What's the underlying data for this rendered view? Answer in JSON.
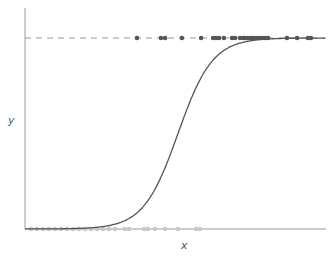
{
  "chart_data": {
    "type": "scatter",
    "title": "",
    "xlabel": "x",
    "ylabel": "y",
    "xlim": [
      0,
      1
    ],
    "ylim": [
      0,
      1
    ],
    "grid": false,
    "legend": null,
    "reference_line": {
      "y": 1,
      "style": "dashed",
      "color": "#999999"
    },
    "curve": {
      "name": "logistic fit",
      "type": "sigmoid",
      "midpoint_x": 0.51,
      "steepness": 17.4,
      "color": "#555555"
    },
    "series": [
      {
        "name": "y = 1",
        "color": "#555555",
        "y": 1,
        "x": [
          0.373,
          0.453,
          0.467,
          0.523,
          0.587,
          0.627,
          0.637,
          0.647,
          0.663,
          0.69,
          0.7,
          0.717,
          0.727,
          0.733,
          0.743,
          0.753,
          0.76,
          0.77,
          0.78,
          0.79,
          0.8,
          0.81,
          0.873,
          0.907,
          0.943,
          0.953
        ]
      },
      {
        "name": "y = 0",
        "color": "#c8c8c8",
        "y": 0,
        "x": [
          0.02,
          0.04,
          0.06,
          0.08,
          0.1,
          0.12,
          0.14,
          0.16,
          0.18,
          0.2,
          0.22,
          0.24,
          0.26,
          0.28,
          0.3,
          0.333,
          0.347,
          0.397,
          0.41,
          0.433,
          0.467,
          0.51,
          0.57,
          0.583
        ]
      }
    ]
  }
}
